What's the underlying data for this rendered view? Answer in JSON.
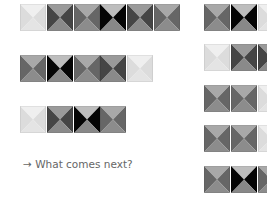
{
  "palette": {
    "light": {
      "top": "#efefef",
      "side": "#dcdcdc",
      "bottom": "#e4e4e4"
    },
    "medium": {
      "top": "#a8a8a8",
      "side": "#666666",
      "bottom": "#8c8c8c"
    },
    "dark": {
      "top": "#9a9a9a",
      "side": "#454545",
      "bottom": "#8a8a8a"
    },
    "black": {
      "top": "#bdbdbd",
      "side": "#050505",
      "bottom": "#888888"
    }
  },
  "sequence_rows": [
    [
      "light",
      "dark",
      "medium",
      "black",
      "dark",
      "medium"
    ],
    [
      "medium",
      "black",
      "medium",
      "dark",
      "light"
    ],
    [
      "light",
      "dark",
      "black",
      "medium"
    ]
  ],
  "options": [
    [
      "medium",
      "black",
      "light"
    ],
    [
      "light",
      "dark",
      "dark"
    ],
    [
      "medium",
      "medium",
      "light"
    ],
    [
      "medium",
      "medium",
      "light"
    ],
    [
      "medium",
      "black",
      "medium"
    ]
  ],
  "prompt": {
    "arrow": "→",
    "text": "What comes next?"
  }
}
